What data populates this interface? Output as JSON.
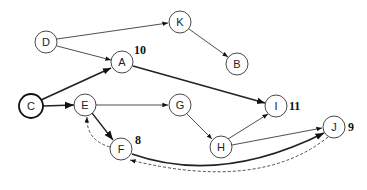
{
  "diagram": {
    "type": "directed-graph",
    "nodes": [
      {
        "id": "D",
        "label": "D",
        "x": 46,
        "y": 42,
        "bold": false
      },
      {
        "id": "K",
        "label": "K",
        "x": 180,
        "y": 22,
        "bold": false
      },
      {
        "id": "A",
        "label": "A",
        "x": 122,
        "y": 62,
        "bold": false
      },
      {
        "id": "B",
        "label": "B",
        "x": 237,
        "y": 64,
        "bold": false
      },
      {
        "id": "C",
        "label": "C",
        "x": 31,
        "y": 106,
        "bold": true
      },
      {
        "id": "E",
        "label": "E",
        "x": 85,
        "y": 105,
        "bold": false
      },
      {
        "id": "G",
        "label": "G",
        "x": 180,
        "y": 105,
        "bold": false
      },
      {
        "id": "I",
        "label": "I",
        "x": 276,
        "y": 106,
        "bold": false
      },
      {
        "id": "F",
        "label": "F",
        "x": 121,
        "y": 149,
        "bold": false
      },
      {
        "id": "H",
        "label": "H",
        "x": 221,
        "y": 147,
        "bold": false
      },
      {
        "id": "J",
        "label": "J",
        "x": 334,
        "y": 127,
        "bold": false
      }
    ],
    "weights": [
      {
        "node": "A",
        "value": "10",
        "x": 134,
        "y": 54
      },
      {
        "node": "I",
        "value": "11",
        "x": 289,
        "y": 110
      },
      {
        "node": "F",
        "value": "8",
        "x": 135,
        "y": 144
      },
      {
        "node": "J",
        "value": "9",
        "x": 348,
        "y": 131
      }
    ],
    "edges": [
      {
        "from": "D",
        "to": "K",
        "style": "thin"
      },
      {
        "from": "D",
        "to": "A",
        "style": "thin"
      },
      {
        "from": "K",
        "to": "B",
        "style": "thin"
      },
      {
        "from": "C",
        "to": "A",
        "style": "bold"
      },
      {
        "from": "A",
        "to": "I",
        "style": "bold"
      },
      {
        "from": "C",
        "to": "E",
        "style": "bold"
      },
      {
        "from": "E",
        "to": "G",
        "style": "thin"
      },
      {
        "from": "E",
        "to": "F",
        "style": "bold"
      },
      {
        "from": "G",
        "to": "H",
        "style": "thin"
      },
      {
        "from": "H",
        "to": "I",
        "style": "thin"
      },
      {
        "from": "H",
        "to": "J",
        "style": "thin"
      },
      {
        "from": "F",
        "to": "J",
        "style": "bold-curve"
      },
      {
        "from": "F",
        "to": "E",
        "style": "dashed-curve"
      },
      {
        "from": "J",
        "to": "F",
        "style": "dashed-curve"
      }
    ]
  }
}
